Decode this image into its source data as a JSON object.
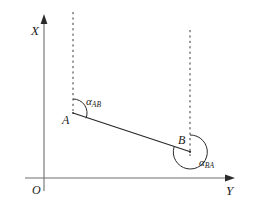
{
  "figure": {
    "type": "geometry-diagram",
    "background_color": "#ffffff",
    "line_color": "#3a3a3a",
    "text_color": "#1a1a1a",
    "width": 254,
    "height": 210
  },
  "axes": {
    "vertical": {
      "label": "X",
      "label_x": 31,
      "label_y": 24,
      "x": 44,
      "y_top": 18,
      "y_bottom": 191,
      "arrow": "up"
    },
    "horizontal": {
      "label": "Y",
      "label_x": 226,
      "label_y": 184,
      "y": 178,
      "x_left": 25,
      "x_right": 233,
      "arrow": "right"
    },
    "origin": {
      "label": "O",
      "label_x": 32,
      "label_y": 184
    }
  },
  "points": [
    {
      "name": "A",
      "label": "A",
      "x": 73,
      "y": 113,
      "label_x": 62,
      "label_y": 114
    },
    {
      "name": "B",
      "label": "B",
      "x": 190,
      "y": 152,
      "label_x": 178,
      "label_y": 134
    }
  ],
  "segments": [
    {
      "name": "line-AB",
      "from": "A",
      "to": "B",
      "style": "solid",
      "x1": 73,
      "y1": 113,
      "x2": 191,
      "y2": 152
    }
  ],
  "dashed_lines": [
    {
      "name": "meridian-through-A",
      "x": 73,
      "y_top": 12,
      "y_bottom": 110
    },
    {
      "name": "meridian-through-B",
      "x": 190,
      "y_top": 30,
      "y_bottom": 155
    }
  ],
  "angles": [
    {
      "name": "alpha-AB",
      "symbol": "α",
      "subscript": "AB",
      "vertex": "A",
      "label_x": 86,
      "label_y": 96,
      "arc_radius": 14,
      "reflex": false
    },
    {
      "name": "alpha-BA",
      "symbol": "α",
      "subscript": "BA",
      "vertex": "B",
      "label_x": 199,
      "label_y": 157,
      "arc_radius": 17,
      "reflex": true
    }
  ]
}
